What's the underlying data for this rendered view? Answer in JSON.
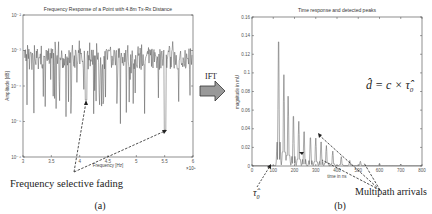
{
  "middle": {
    "arrow_label": "IFT"
  },
  "captions": {
    "left": "(a)",
    "right": "(b)",
    "left_annotation": "Frequency selective fading",
    "right_annotation": "Multipath arrivals",
    "tau_label": "τ̂",
    "tau_sub": "0",
    "equation_lhs": "d̂",
    "equation_rhs": " = c × τ̂",
    "equation_sub": "0"
  },
  "chart_data": [
    {
      "type": "line",
      "title": "Frequency Response of a Point with 4.8m Tx-Rx Distance",
      "xlabel": "Frequency [Hz]",
      "ylabel": "Amplitude [dB]",
      "x_multiplier": "×10⁹",
      "xlim": [
        3,
        6
      ],
      "ylim_log": [
        -6,
        -2
      ],
      "yscale": "log",
      "xticks": [
        "3",
        "3.5",
        "4",
        "4.5",
        "5",
        "5.5",
        "6"
      ],
      "yticks": [
        "10⁻²",
        "10⁻³",
        "10⁻⁴",
        "10⁻⁵",
        "10⁻⁶"
      ],
      "grid": false,
      "description": "Noisy amplitude spectrum fluctuating mostly between 10^-3.5 and 10^-2.5 with deep fades (frequency selective fading) reaching toward 10^-5."
    },
    {
      "type": "line",
      "title": "Time response and detected peaks",
      "xlabel": "time in ns",
      "ylabel": "magnitude in mU",
      "xlim": [
        0,
        800
      ],
      "ylim": [
        0,
        0.16
      ],
      "xticks": [
        "0",
        "100",
        "200",
        "300",
        "400",
        "500",
        "600",
        "700",
        "800"
      ],
      "yticks": [
        "0.16",
        "0.14",
        "0.12",
        "0.1",
        "0.08",
        "0.06",
        "0.04",
        "0.02",
        "0"
      ],
      "grid": false,
      "peaks": [
        {
          "t": 125,
          "v": 0.145
        },
        {
          "t": 150,
          "v": 0.098
        },
        {
          "t": 170,
          "v": 0.075
        },
        {
          "t": 195,
          "v": 0.058
        },
        {
          "t": 220,
          "v": 0.048
        },
        {
          "t": 245,
          "v": 0.04
        },
        {
          "t": 275,
          "v": 0.033
        },
        {
          "t": 300,
          "v": 0.03
        },
        {
          "t": 325,
          "v": 0.028
        },
        {
          "t": 350,
          "v": 0.022
        },
        {
          "t": 380,
          "v": 0.016
        },
        {
          "t": 420,
          "v": 0.01
        },
        {
          "t": 460,
          "v": 0.006
        },
        {
          "t": 510,
          "v": 0.005
        },
        {
          "t": 600,
          "v": 0.003
        },
        {
          "t": 700,
          "v": 0.002
        }
      ]
    }
  ]
}
